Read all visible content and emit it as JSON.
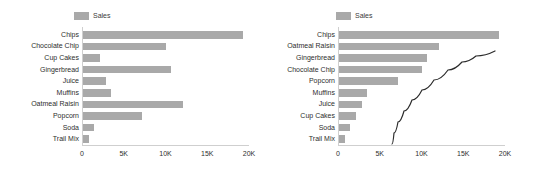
{
  "chart_data": [
    {
      "id": "left",
      "type": "bar",
      "orientation": "horizontal",
      "title": "",
      "xlabel": "",
      "ylabel": "",
      "legend": {
        "label": "Sales",
        "position": "top-left",
        "color": "#a9a9a9"
      },
      "grid": false,
      "xlim": [
        0,
        20000
      ],
      "xticks": [
        0,
        5000,
        10000,
        15000,
        20000
      ],
      "xtick_labels": [
        "0",
        "5K",
        "10K",
        "15K",
        "20K"
      ],
      "categories": [
        "Chips",
        "Chocolate Chip",
        "Cup Cakes",
        "Gingerbread",
        "Juice",
        "Muffins",
        "Oatmeal Raisin",
        "Popcorn",
        "Soda",
        "Trail Mix"
      ],
      "values": [
        19300,
        10000,
        2200,
        10600,
        2900,
        3500,
        12100,
        7200,
        1400,
        800
      ],
      "series": [
        {
          "name": "Sales",
          "values": [
            19300,
            10000,
            2200,
            10600,
            2900,
            3500,
            12100,
            7200,
            1400,
            800
          ]
        }
      ]
    },
    {
      "id": "right",
      "type": "bar",
      "orientation": "horizontal",
      "title": "",
      "xlabel": "",
      "ylabel": "",
      "legend": {
        "label": "Sales",
        "position": "top-left",
        "color": "#a9a9a9"
      },
      "grid": false,
      "xlim": [
        0,
        20000
      ],
      "xticks": [
        0,
        5000,
        10000,
        15000,
        20000
      ],
      "xtick_labels": [
        "0",
        "5K",
        "10K",
        "15K",
        "20K"
      ],
      "categories": [
        "Chips",
        "Oatmeal Raisin",
        "Gingerbread",
        "Chocolate Chip",
        "Popcorn",
        "Muffins",
        "Juice",
        "Cup Cakes",
        "Soda",
        "Trail Mix"
      ],
      "values": [
        19300,
        12100,
        10600,
        10000,
        7200,
        3500,
        2900,
        2200,
        1400,
        800
      ],
      "series": [
        {
          "name": "Sales",
          "values": [
            19300,
            12100,
            10600,
            10000,
            7200,
            3500,
            2900,
            2200,
            1400,
            800
          ]
        }
      ],
      "annotation_curve": {
        "name": "cumulative-curve",
        "color": "#2b2b2b",
        "width": 1.2,
        "points_px": [
          [
            392,
            144
          ],
          [
            394,
            133
          ],
          [
            398,
            122
          ],
          [
            404,
            111
          ],
          [
            412,
            100
          ],
          [
            422,
            90
          ],
          [
            434,
            80
          ],
          [
            448,
            70
          ],
          [
            462,
            62
          ],
          [
            476,
            56
          ],
          [
            495,
            51
          ]
        ]
      }
    }
  ]
}
